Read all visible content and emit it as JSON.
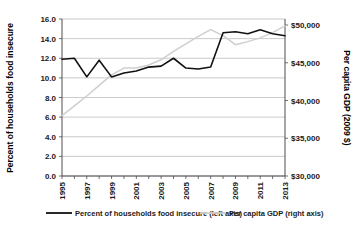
{
  "chart_data": {
    "type": "line",
    "title": "",
    "xlabel": "",
    "ylabel": "Percent of households food insecure",
    "y2label": "Per capita GDP (2009 $)",
    "grid": true,
    "legend_position": "bottom",
    "x": [
      1995,
      1996,
      1997,
      1998,
      1999,
      2000,
      2001,
      2002,
      2003,
      2004,
      2005,
      2006,
      2007,
      2008,
      2009,
      2010,
      2011,
      2012,
      2013
    ],
    "xtick_labels": [
      "1995",
      "1997",
      "1999",
      "2001",
      "2003",
      "2005",
      "2007",
      "2009",
      "2011",
      "2013"
    ],
    "xtick_values": [
      1995,
      1997,
      1999,
      2001,
      2003,
      2005,
      2007,
      2009,
      2011,
      2013
    ],
    "ylim": [
      0.0,
      16.0
    ],
    "ytick_labels": [
      "0.0",
      "2.0",
      "4.0",
      "6.0",
      "8.0",
      "10.0",
      "12.0",
      "14.0",
      "16.0"
    ],
    "ytick_values": [
      0.0,
      2.0,
      4.0,
      6.0,
      8.0,
      10.0,
      12.0,
      14.0,
      16.0
    ],
    "y2lim": [
      30000,
      50800
    ],
    "y2tick_labels": [
      "$30,000",
      "$35,000",
      "$40,000",
      "$45,000",
      "$50,000"
    ],
    "y2tick_values": [
      30000,
      35000,
      40000,
      45000,
      50000
    ],
    "series": [
      {
        "name": "Percent of households food insecure (left axis)",
        "axis": "left",
        "color": "#111111",
        "style": "solid",
        "values": [
          11.9,
          12.0,
          10.1,
          11.8,
          10.1,
          10.5,
          10.7,
          11.1,
          11.2,
          12.0,
          11.0,
          10.9,
          11.1,
          14.6,
          14.7,
          14.5,
          14.9,
          14.5,
          14.3
        ]
      },
      {
        "name": "Per capita GDP (right axis)",
        "axis": "right",
        "color": "#cfcfcf",
        "style": "solid",
        "values": [
          38000,
          39300,
          40600,
          42000,
          43400,
          44300,
          44300,
          44700,
          45400,
          46500,
          47500,
          48500,
          49400,
          48600,
          47400,
          47800,
          48300,
          49000,
          49900
        ]
      }
    ],
    "legend": [
      {
        "label": "Percent of households food insecure (left axis)",
        "color": "#111111"
      },
      {
        "label": "Per capita GDP (right axis)",
        "color": "#cfcfcf"
      }
    ]
  }
}
